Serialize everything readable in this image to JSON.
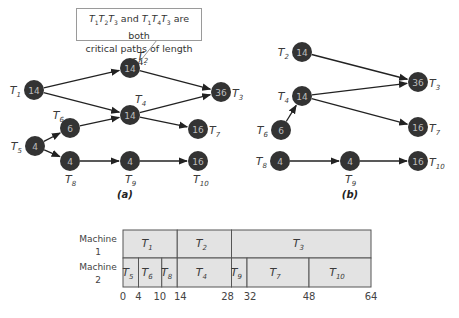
{
  "callout": {
    "text_line1": "T1T2T3 and T1T4T3 are both",
    "text_line2": "critical paths of length 64."
  },
  "graph_a": {
    "caption": "(a)",
    "nodes": [
      {
        "id": "T1",
        "label": "T",
        "sub": "1",
        "value": "14"
      },
      {
        "id": "T2",
        "label": "T",
        "sub": "2",
        "value": "14"
      },
      {
        "id": "T3",
        "label": "T",
        "sub": "3",
        "value": "36"
      },
      {
        "id": "T4",
        "label": "T",
        "sub": "4",
        "value": "14"
      },
      {
        "id": "T5",
        "label": "T",
        "sub": "5",
        "value": "4"
      },
      {
        "id": "T6",
        "label": "T",
        "sub": "6",
        "value": "6"
      },
      {
        "id": "T7",
        "label": "T",
        "sub": "7",
        "value": "16"
      },
      {
        "id": "T8",
        "label": "T",
        "sub": "8",
        "value": "4"
      },
      {
        "id": "T9",
        "label": "T",
        "sub": "9",
        "value": "4"
      },
      {
        "id": "T10",
        "label": "T",
        "sub": "10",
        "value": "16"
      }
    ],
    "edges": [
      [
        "T1",
        "T2"
      ],
      [
        "T1",
        "T4"
      ],
      [
        "T2",
        "T3"
      ],
      [
        "T4",
        "T3"
      ],
      [
        "T4",
        "T7"
      ],
      [
        "T5",
        "T6"
      ],
      [
        "T5",
        "T8"
      ],
      [
        "T6",
        "T4"
      ],
      [
        "T8",
        "T9"
      ],
      [
        "T9",
        "T10"
      ]
    ]
  },
  "graph_b": {
    "caption": "(b)",
    "nodes": [
      {
        "id": "T2",
        "label": "T",
        "sub": "2",
        "value": "14"
      },
      {
        "id": "T3",
        "label": "T",
        "sub": "3",
        "value": "36"
      },
      {
        "id": "T4",
        "label": "T",
        "sub": "4",
        "value": "14"
      },
      {
        "id": "T6",
        "label": "T",
        "sub": "6",
        "value": "6"
      },
      {
        "id": "T7",
        "label": "T",
        "sub": "7",
        "value": "16"
      },
      {
        "id": "T8",
        "label": "T",
        "sub": "8",
        "value": "4"
      },
      {
        "id": "T9",
        "label": "T",
        "sub": "9",
        "value": "4"
      },
      {
        "id": "T10",
        "label": "T",
        "sub": "10",
        "value": "16"
      }
    ],
    "edges": [
      [
        "T2",
        "T3"
      ],
      [
        "T4",
        "T3"
      ],
      [
        "T4",
        "T7"
      ],
      [
        "T6",
        "T4"
      ],
      [
        "T8",
        "T9"
      ],
      [
        "T9",
        "T10"
      ]
    ]
  },
  "gantt": {
    "machines": [
      {
        "name_line1": "Machine",
        "name_line2": "1",
        "tasks": [
          {
            "label": "T",
            "sub": "1",
            "start": 0,
            "end": 14
          },
          {
            "label": "T",
            "sub": "2",
            "start": 14,
            "end": 28
          },
          {
            "label": "T",
            "sub": "3",
            "start": 28,
            "end": 64
          }
        ]
      },
      {
        "name_line1": "Machine",
        "name_line2": "2",
        "tasks": [
          {
            "label": "T",
            "sub": "5",
            "start": 0,
            "end": 4
          },
          {
            "label": "T",
            "sub": "6",
            "start": 4,
            "end": 10
          },
          {
            "label": "T",
            "sub": "8",
            "start": 10,
            "end": 14
          },
          {
            "label": "T",
            "sub": "4",
            "start": 14,
            "end": 28
          },
          {
            "label": "T",
            "sub": "9",
            "start": 28,
            "end": 32
          },
          {
            "label": "T",
            "sub": "7",
            "start": 32,
            "end": 48
          },
          {
            "label": "T",
            "sub": "10",
            "start": 48,
            "end": 64
          }
        ]
      }
    ],
    "ticks": [
      "0",
      "4",
      "10",
      "14",
      "28",
      "32",
      "48",
      "64"
    ],
    "tick_values": [
      0,
      4,
      10,
      14,
      28,
      32,
      48,
      64
    ],
    "colors": {
      "bar_fill": "#e3e3e3",
      "bar_stroke": "#555555"
    }
  },
  "colors": {
    "node_fill": "#333333",
    "node_text": "#bdbdbd",
    "edge": "#222222"
  }
}
